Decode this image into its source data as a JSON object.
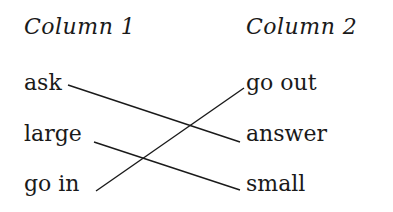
{
  "headers": {
    "col1": "Column 1",
    "col2": "Column 2"
  },
  "column1": [
    "ask",
    "large",
    "go in"
  ],
  "column2": [
    "go out",
    "answer",
    "small"
  ],
  "matches": [
    {
      "from": "ask",
      "to": "answer"
    },
    {
      "from": "large",
      "to": "small"
    },
    {
      "from": "go in",
      "to": "go out"
    }
  ]
}
